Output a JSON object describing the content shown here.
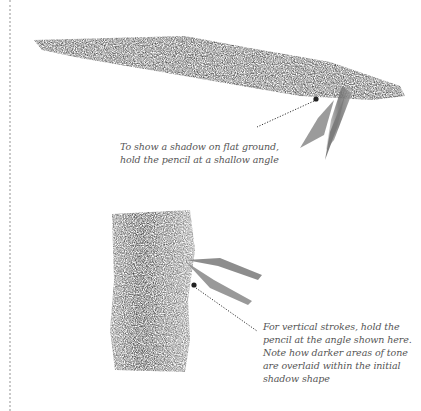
{
  "page": {
    "top_fragment": "…",
    "illustrations": [
      {
        "name": "flat-shadow",
        "caption_lines": [
          "To show a shadow on flat ground,",
          "hold the pencil at a shallow angle"
        ]
      },
      {
        "name": "vertical-strokes",
        "caption_lines": [
          "For vertical strokes, hold the",
          "pencil at the angle shown here.",
          "Note how darker areas of tone",
          "are overlaid within the initial",
          "shadow shape"
        ]
      }
    ],
    "colors": {
      "graphite": "#6b6b6b",
      "graphite_dark": "#3e3e3e",
      "caption": "#555555",
      "margin_dots": "#c9c9c9"
    }
  }
}
